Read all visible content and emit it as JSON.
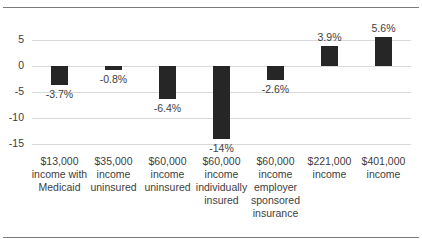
{
  "chart_data": {
    "type": "bar",
    "title": "",
    "xlabel": "",
    "ylabel": "",
    "ylim": [
      -15,
      5
    ],
    "yticks": [
      5,
      0,
      -5,
      -10,
      -15
    ],
    "grid": true,
    "legend": null,
    "categories": [
      "$13,000 income with Medicaid",
      "$35,000 income uninsured",
      "$60,000 income uninsured",
      "$60,000 income individually insured",
      "$60,000 income employer sponsored insurance",
      "$221,000 income",
      "$401,000 income"
    ],
    "values": [
      -3.7,
      -0.8,
      -6.4,
      -14,
      -2.6,
      3.9,
      5.6
    ],
    "data_labels": [
      "-3.7%",
      "-0.8%",
      "-6.4%",
      "-14%",
      "-2.6%",
      "3.9%",
      "5.6%"
    ],
    "bar_color": "#262626"
  },
  "axis": {
    "yticks": [
      "5",
      "0",
      "-5",
      "-10",
      "-15"
    ]
  },
  "categories_display": [
    "$13,000\nincome with\nMedicaid",
    "$35,000\nincome\nuninsured",
    "$60,000\nincome\nuninsured",
    "$60,000\nincome\nindividually\ninsured",
    "$60,000\nincome\nemployer\nsponsored\ninsurance",
    "$221,000\nincome",
    "$401,000\nincome"
  ]
}
